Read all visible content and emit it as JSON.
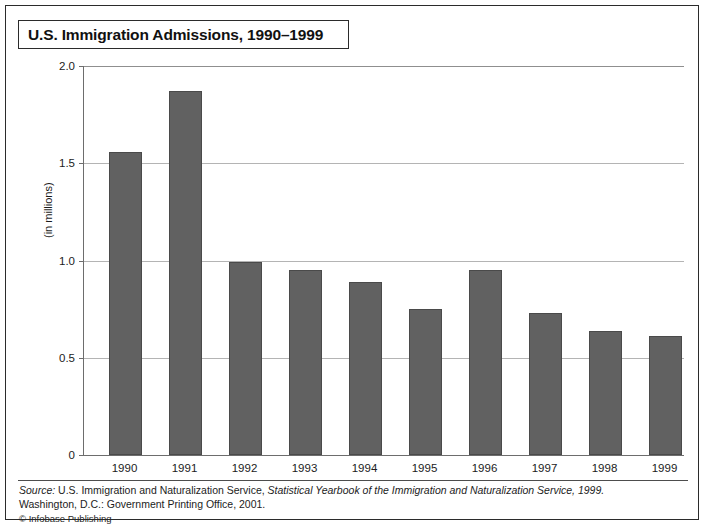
{
  "figure": {
    "title": "U.S. Immigration Admissions, 1990–1999",
    "ylabel": "(in millions)",
    "source_prefix": "Source:",
    "source_part1": " U.S. Immigration and Naturalization Service, ",
    "source_italic": "Statistical Yearbook of the Immigration and Naturalization Service, 1999.",
    "source_line2": "Washington, D.C.: Government Printing Office, 2001.",
    "credit": "© Infobase Publishing"
  },
  "colors": {
    "bar_fill": "#616161",
    "bar_edge": "#4a4a4a",
    "grid": "#b4b4b4",
    "axis": "#6d6d6d",
    "frame": "#2b2b2b",
    "text": "#1c1c1c"
  },
  "chart_data": {
    "type": "bar",
    "title": "U.S. Immigration Admissions, 1990–1999",
    "xlabel": "",
    "ylabel": "(in millions)",
    "categories": [
      "1990",
      "1991",
      "1992",
      "1993",
      "1994",
      "1995",
      "1996",
      "1997",
      "1998",
      "1999"
    ],
    "values": [
      1.56,
      1.87,
      0.99,
      0.95,
      0.89,
      0.75,
      0.95,
      0.73,
      0.64,
      0.61
    ],
    "ylim": [
      0,
      2.0
    ],
    "yticks": [
      0,
      0.5,
      1.0,
      1.5,
      2.0
    ],
    "ytick_labels": [
      "0",
      "0.5",
      "1.0",
      "1.5",
      "2.0"
    ],
    "grid": true,
    "legend": false,
    "legend_position": "none"
  }
}
